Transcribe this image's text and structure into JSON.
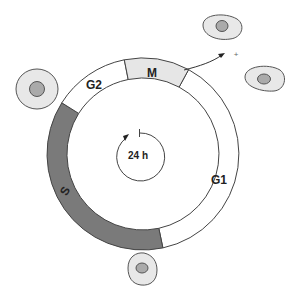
{
  "diagram": {
    "center_label": "24 h",
    "phases": [
      {
        "id": "M",
        "label": "M",
        "fill": "#e6e6e6"
      },
      {
        "id": "G1",
        "label": "G1",
        "fill": "#ffffff"
      },
      {
        "id": "S",
        "label": "S",
        "fill": "#7a7a7a"
      },
      {
        "id": "G2",
        "label": "G2",
        "fill": "#ffffff"
      }
    ],
    "division_symbol": "+",
    "colors": {
      "stroke": "#444444",
      "cell_fill": "#e8e8e8",
      "nucleus_fill": "#aaaaaa",
      "s_phase": "#7a7a7a",
      "m_phase": "#e6e6e6"
    },
    "cells": [
      {
        "id": "cell-left",
        "description": "round cell before mitosis"
      },
      {
        "id": "cell-top-right-1",
        "description": "daughter cell"
      },
      {
        "id": "cell-top-right-2",
        "description": "daughter cell"
      },
      {
        "id": "cell-bottom",
        "description": "cell in G1"
      }
    ]
  }
}
